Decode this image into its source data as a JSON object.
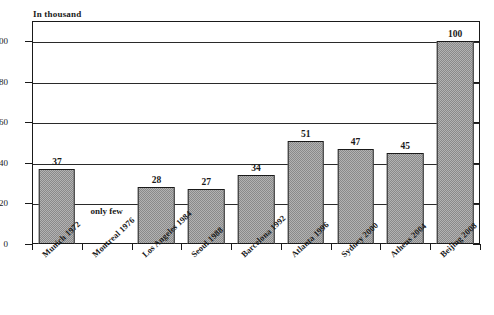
{
  "chart_data": {
    "type": "bar",
    "title": "",
    "unit_caption": "In thousand",
    "xlabel": "",
    "ylabel": "",
    "ylim": [
      0,
      110
    ],
    "yticks": [
      0,
      20,
      40,
      60,
      80,
      100
    ],
    "grid": true,
    "legend": "none",
    "categories": [
      "Munich 1972",
      "Montreal 1976",
      "Los Angeles 1984",
      "Seoul 1988",
      "Barcelona 1992",
      "Atlanta 1996",
      "Sydney 2000",
      "Athens 2004",
      "Beijing 2008"
    ],
    "values": [
      37,
      null,
      28,
      27,
      34,
      51,
      47,
      45,
      100
    ],
    "value_labels": [
      "37",
      "",
      "28",
      "27",
      "34",
      "51",
      "47",
      "45",
      "100"
    ],
    "annotations": [
      {
        "category": "Montreal 1976",
        "text": "only few"
      }
    ]
  },
  "style": {
    "bar_fill": "#cfcfcf",
    "bar_edge": "#1a1a1a",
    "axis_color": "#1a1a1a",
    "grid_color": "#2a2a2a",
    "background": "#ffffff"
  }
}
